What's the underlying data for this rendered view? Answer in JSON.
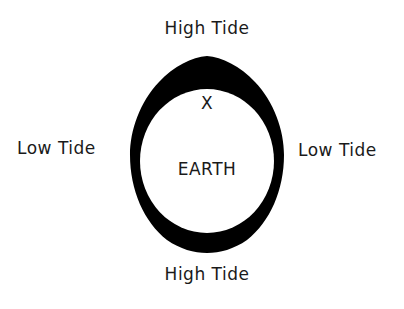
{
  "diagram": {
    "labels": {
      "top": "High Tide",
      "bottom": "High Tide",
      "left": "Low Tide",
      "right": "Low Tide",
      "center": "EARTH",
      "marker": "X"
    },
    "colors": {
      "background": "#ffffff",
      "bulge_fill": "#000000",
      "earth_fill": "#ffffff",
      "text": "#1a1a1a"
    },
    "shapes": {
      "earth": {
        "cx": 207,
        "cy": 160,
        "rx": 67,
        "ry": 73
      },
      "water_envelope": {
        "top_peak": [
          207,
          56
        ],
        "bottom_peak": [
          207,
          253
        ],
        "left_edge_x": 130,
        "right_edge_x": 284
      }
    }
  }
}
